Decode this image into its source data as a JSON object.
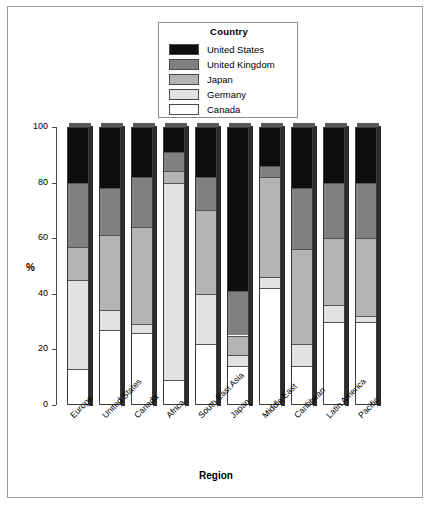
{
  "chart_data": {
    "type": "bar",
    "subtype": "stacked-bar-100-percent",
    "title": "",
    "xlabel": "Region",
    "ylabel": "%",
    "ylim": [
      0,
      100
    ],
    "yticks": [
      0,
      20,
      40,
      60,
      80,
      100
    ],
    "grid": false,
    "legend_title": "Country",
    "legend_position": "top-center-inside",
    "categories": [
      "Europe",
      "United States",
      "Canada",
      "Africa",
      "South East Asia",
      "Japan",
      "Middle East",
      "Caribbean",
      "Latin America",
      "Pacific"
    ],
    "series": [
      {
        "name": "Canada",
        "color": "#ffffff",
        "values": [
          13,
          27,
          26,
          9,
          22,
          14,
          42,
          14,
          30,
          30
        ]
      },
      {
        "name": "Germany",
        "color": "#e2e2e2",
        "values": [
          32,
          7,
          3,
          71,
          18,
          4,
          4,
          8,
          6,
          2
        ]
      },
      {
        "name": "Japan",
        "color": "#b4b4b4",
        "values": [
          12,
          27,
          35,
          4,
          30,
          7,
          36,
          34,
          24,
          28
        ]
      },
      {
        "name": "United Kingdom",
        "color": "#808080",
        "values": [
          23,
          17,
          18,
          7,
          12,
          16,
          4,
          22,
          20,
          20
        ]
      },
      {
        "name": "United States",
        "color": "#0d0d0d",
        "values": [
          20,
          22,
          18,
          9,
          18,
          59,
          14,
          22,
          20,
          20
        ]
      }
    ],
    "legend_order": [
      "United States",
      "United Kingdom",
      "Japan",
      "Germany",
      "Canada"
    ]
  }
}
